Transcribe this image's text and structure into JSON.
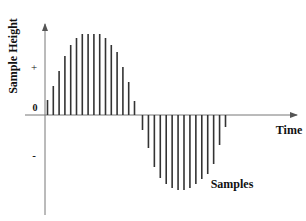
{
  "diagram": {
    "y_axis_label": "Sample Height",
    "x_axis_label": "Time",
    "series_label": "Samples",
    "tick_labels": {
      "plus": "+",
      "zero": "0",
      "minus": "-"
    },
    "colors": {
      "axis": "#555555",
      "stem": "#333333",
      "text": "#111111"
    }
  },
  "chart_data": {
    "type": "stem",
    "title": "",
    "xlabel": "Time",
    "ylabel": "Sample Height",
    "y_ticks": [
      "+",
      "0",
      "-"
    ],
    "legend": "Samples",
    "positive_half": [
      15,
      29,
      44,
      59,
      70,
      77,
      81,
      81,
      81,
      81,
      77,
      70,
      63,
      48,
      33,
      14
    ],
    "negative_half": [
      -15,
      -33,
      -52,
      -63,
      -69,
      -73,
      -75,
      -75,
      -73,
      -69,
      -64,
      -59,
      -49,
      -30,
      -12
    ],
    "grid": false
  }
}
